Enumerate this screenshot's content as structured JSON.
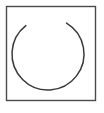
{
  "figure": {
    "title": "Open circular arc inside a square frame",
    "canvas": {
      "width": 104,
      "height": 113,
      "background_color": "#ffffff"
    },
    "frame": {
      "name": "square-border",
      "x": 6.5,
      "y": 6.5,
      "width": 89,
      "height": 94,
      "stroke_color": "#4a4a4a",
      "stroke_width": 1.4,
      "fill": "none"
    },
    "arc": {
      "name": "open-circle-arc",
      "shape": "arc",
      "center_x": 48,
      "center_y": 54,
      "radius": 36,
      "start_angle_deg": -59,
      "end_angle_deg": 232,
      "sweep_deg": 291,
      "gap_deg": 69,
      "gap_location": "upper-right",
      "stroke_color": "#3a3a3a",
      "stroke_width": 1.5,
      "stroke_linecap": "round",
      "fill": "none",
      "path_d": "M 66.54 84.86 A 36 36 0 1 1 70.54 27.26",
      "endpoints": {
        "start": {
          "x": 81.5,
          "y": 53.1,
          "label": "right-terminus"
        },
        "end": {
          "x": 53.5,
          "y": 16.2,
          "label": "top-terminus"
        }
      }
    },
    "caption": ""
  }
}
